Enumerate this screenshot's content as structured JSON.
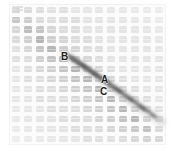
{
  "figure": {
    "width": 175,
    "height": 149,
    "background_color": "#ffffff",
    "plate_background_color": "#fbfbfb",
    "border_color": "#ededed",
    "corner_mark_name": "scale-mark"
  },
  "grid": {
    "columns": 13,
    "rows": 14,
    "cell_base_color": "#dedede",
    "cell_shape": "rounded-rectangle",
    "tone_levels": [
      "#e4e4e4",
      "#dddddd",
      "#d6d6d6",
      "#cfcfcf",
      "#c4c4c4",
      "#b6b6b6",
      "#a8a8a8"
    ],
    "tone_map": [
      [
        4,
        3,
        2,
        1,
        1,
        0,
        0,
        0,
        0,
        0,
        0,
        0,
        0
      ],
      [
        5,
        4,
        2,
        1,
        1,
        1,
        0,
        0,
        0,
        0,
        0,
        0,
        0
      ],
      [
        3,
        5,
        4,
        2,
        1,
        1,
        0,
        0,
        0,
        0,
        0,
        0,
        0
      ],
      [
        2,
        3,
        5,
        3,
        2,
        1,
        1,
        0,
        0,
        0,
        0,
        0,
        0
      ],
      [
        1,
        2,
        4,
        5,
        3,
        2,
        1,
        1,
        0,
        0,
        0,
        0,
        0
      ],
      [
        1,
        1,
        3,
        4,
        5,
        3,
        2,
        1,
        0,
        0,
        0,
        0,
        0
      ],
      [
        0,
        1,
        2,
        3,
        4,
        5,
        3,
        2,
        1,
        0,
        0,
        0,
        0
      ],
      [
        0,
        1,
        1,
        2,
        3,
        4,
        5,
        3,
        2,
        1,
        0,
        0,
        0
      ],
      [
        0,
        0,
        1,
        1,
        2,
        3,
        4,
        5,
        3,
        2,
        1,
        0,
        0
      ],
      [
        0,
        0,
        1,
        1,
        1,
        2,
        3,
        4,
        5,
        3,
        2,
        1,
        0
      ],
      [
        0,
        0,
        0,
        1,
        1,
        1,
        2,
        3,
        4,
        5,
        3,
        2,
        1
      ],
      [
        0,
        0,
        0,
        0,
        1,
        1,
        1,
        2,
        3,
        4,
        5,
        3,
        2
      ],
      [
        0,
        0,
        0,
        0,
        0,
        1,
        1,
        1,
        2,
        3,
        4,
        5,
        3
      ],
      [
        0,
        0,
        0,
        0,
        0,
        0,
        1,
        1,
        1,
        2,
        3,
        4,
        4
      ]
    ]
  },
  "defect": {
    "name": "diagonal-scratch",
    "description": "dark diagonal streak crossing the array",
    "color": "#6e6e6e",
    "start": {
      "x": 68,
      "y": 56
    },
    "end": {
      "x": 160,
      "y": 120
    }
  },
  "annotations": [
    {
      "id": "B",
      "label": "B",
      "x": 61,
      "y": 52
    },
    {
      "id": "A",
      "label": "A",
      "x": 101,
      "y": 75
    },
    {
      "id": "C",
      "label": "C",
      "x": 100,
      "y": 87
    }
  ]
}
